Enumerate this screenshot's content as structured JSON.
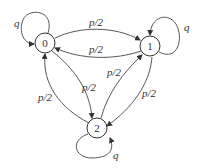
{
  "diagram": {
    "type": "state-transition",
    "nodes": [
      {
        "id": "0",
        "label": "0"
      },
      {
        "id": "1",
        "label": "1"
      },
      {
        "id": "2",
        "label": "2"
      }
    ],
    "edges": [
      {
        "from": "0",
        "to": "0",
        "label": "q"
      },
      {
        "from": "1",
        "to": "1",
        "label": "q"
      },
      {
        "from": "2",
        "to": "2",
        "label": "q"
      },
      {
        "from": "0",
        "to": "1",
        "label": "p/2"
      },
      {
        "from": "1",
        "to": "0",
        "label": "p/2"
      },
      {
        "from": "0",
        "to": "2",
        "label": "p/2"
      },
      {
        "from": "2",
        "to": "0",
        "label": "p/2"
      },
      {
        "from": "2",
        "to": "1",
        "label": "p/2"
      },
      {
        "from": "1",
        "to": "2",
        "label": "p/2"
      }
    ]
  }
}
